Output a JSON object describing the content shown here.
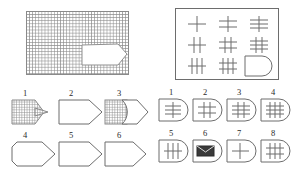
{
  "figure": {
    "type": "raven-progressive-matrix",
    "caption": "",
    "stroke_color": "#6d6d6d",
    "hatch_color": "#8a8a8a",
    "background_color": "#ffffff",
    "fill_dark_color": "#3a3a3a"
  },
  "main_figure": {
    "name": "hatched-rectangle-with-notch",
    "description": "grid-hatched rectangle with white pentagon notch cut from right side",
    "hatched": true,
    "notch_shape": "pentagon-arrow"
  },
  "matrix": {
    "rows": 3,
    "cols": 3,
    "cells": [
      {
        "id": "r1c1",
        "verticals": 1,
        "horizontals": 1,
        "missing": false
      },
      {
        "id": "r1c2",
        "verticals": 1,
        "horizontals": 2,
        "missing": false
      },
      {
        "id": "r1c3",
        "verticals": 1,
        "horizontals": 3,
        "missing": false
      },
      {
        "id": "r2c1",
        "verticals": 2,
        "horizontals": 1,
        "missing": false
      },
      {
        "id": "r2c2",
        "verticals": 2,
        "horizontals": 2,
        "missing": false
      },
      {
        "id": "r2c3",
        "verticals": 2,
        "horizontals": 3,
        "missing": false
      },
      {
        "id": "r3c1",
        "verticals": 3,
        "horizontals": 1,
        "missing": false
      },
      {
        "id": "r3c2",
        "verticals": 3,
        "horizontals": 2,
        "missing": false
      },
      {
        "id": "r3c3",
        "verticals": 0,
        "horizontals": 0,
        "missing": true
      }
    ]
  },
  "left_options": {
    "count": 6,
    "items": [
      {
        "number": "1",
        "style": "hatched",
        "shape": "pentagon",
        "variant": "small-hatched-pentagon"
      },
      {
        "number": "2",
        "style": "outline",
        "shape": "pentagon",
        "variant": "wide-pentagon"
      },
      {
        "number": "3",
        "style": "mixed",
        "shape": "square-plus-pentagon",
        "variant": "hatched-square-with-white-arrow"
      },
      {
        "number": "4",
        "style": "outline",
        "shape": "pentagon",
        "variant": "wide-pentagon"
      },
      {
        "number": "5",
        "style": "outline",
        "shape": "pentagon",
        "variant": "wide-pentagon"
      },
      {
        "number": "6",
        "style": "outline",
        "shape": "pentagon",
        "variant": "short-pentagon"
      }
    ]
  },
  "right_options": {
    "count": 8,
    "items": [
      {
        "number": "1",
        "verticals": 1,
        "horizontals": 3,
        "special": ""
      },
      {
        "number": "2",
        "verticals": 2,
        "horizontals": 2,
        "special": ""
      },
      {
        "number": "3",
        "verticals": 2,
        "horizontals": 3,
        "special": ""
      },
      {
        "number": "4",
        "verticals": 3,
        "horizontals": 3,
        "special": ""
      },
      {
        "number": "5",
        "verticals": 3,
        "horizontals": 1,
        "special": ""
      },
      {
        "number": "6",
        "verticals": 0,
        "horizontals": 0,
        "special": "filled-block"
      },
      {
        "number": "7",
        "verticals": 1,
        "horizontals": 1,
        "special": ""
      },
      {
        "number": "8",
        "verticals": 3,
        "horizontals": 2,
        "special": ""
      }
    ]
  }
}
